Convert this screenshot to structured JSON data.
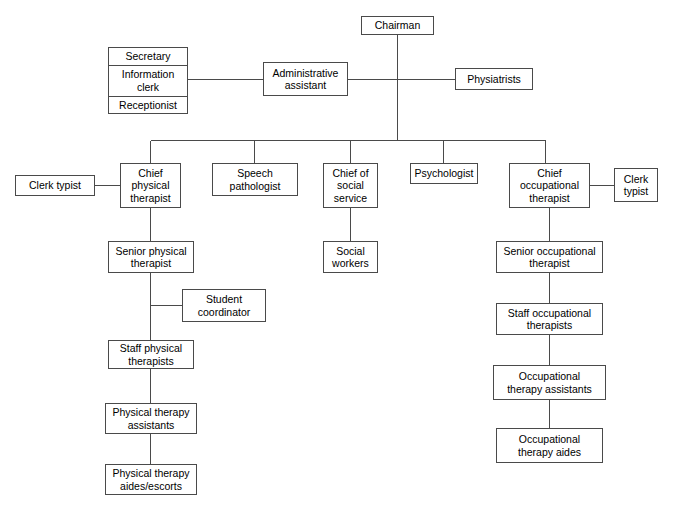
{
  "chart_title": "Rehabilitation Department Organizational Chart",
  "style": {
    "line_color": "#4a4a4a",
    "text_color": "#000000",
    "background": "#ffffff"
  },
  "nodes": {
    "chairman": {
      "label": "Chairman"
    },
    "admin_assistant": {
      "label": "Administrative\nassistant"
    },
    "physiatrists": {
      "label": "Physiatrists"
    },
    "support_stack": {
      "secretary": "Secretary",
      "information_clerk": "Information\nclerk",
      "receptionist": "Receptionist"
    },
    "clerk_typist_left": {
      "label": "Clerk typist"
    },
    "clerk_typist_right": {
      "label": "Clerk\ntypist"
    },
    "chief_physical_therapist": {
      "label": "Chief\nphysical\ntherapist"
    },
    "speech_pathologist": {
      "label": "Speech\npathologist"
    },
    "chief_social_service": {
      "label": "Chief of\nsocial\nservice"
    },
    "psychologist": {
      "label": "Psychologist"
    },
    "chief_occupational_therapist": {
      "label": "Chief\noccupational\ntherapist"
    },
    "senior_physical_therapist": {
      "label": "Senior physical\ntherapist"
    },
    "student_coordinator": {
      "label": "Student\ncoordinator"
    },
    "staff_physical_therapists": {
      "label": "Staff physical\ntherapists"
    },
    "physical_therapy_assistants": {
      "label": "Physical therapy\nassistants"
    },
    "physical_therapy_aides": {
      "label": "Physical therapy\naides/escorts"
    },
    "social_workers": {
      "label": "Social\nworkers"
    },
    "senior_occupational_therapist": {
      "label": "Senior occupational\ntherapist"
    },
    "staff_occupational_therapists": {
      "label": "Staff occupational\ntherapists"
    },
    "occupational_therapy_assistants": {
      "label": "Occupational\ntherapy assistants"
    },
    "occupational_therapy_aides": {
      "label": "Occupational\ntherapy aides"
    }
  }
}
